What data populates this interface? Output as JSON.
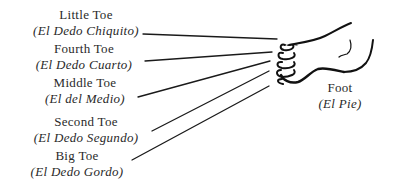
{
  "diagram": {
    "type": "labeled-illustration",
    "subject": "foot",
    "labels": [
      {
        "id": "little-toe",
        "english": "Little Toe",
        "spanish": "(El Dedo Chiquito)"
      },
      {
        "id": "fourth-toe",
        "english": "Fourth Toe",
        "spanish": "(El Dedo Cuarto)"
      },
      {
        "id": "middle-toe",
        "english": "Middle Toe",
        "spanish": "(El del Medio)"
      },
      {
        "id": "second-toe",
        "english": "Second Toe",
        "spanish": "(El Dedo Segundo)"
      },
      {
        "id": "big-toe",
        "english": "Big Toe",
        "spanish": "(El Dedo Gordo)"
      }
    ],
    "foot_label": {
      "english": "Foot",
      "spanish": "(El Pie)"
    }
  }
}
